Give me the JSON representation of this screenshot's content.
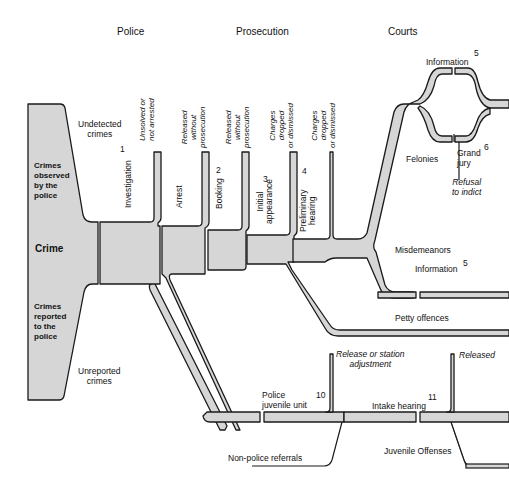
{
  "stages": {
    "police": "Police",
    "prosecution": "Prosecution",
    "courts": "Courts"
  },
  "left_block": {
    "undetected": "Undetected\ncrimes",
    "observed": "Crimes\nobserved\nby the\npolice",
    "crime": "Crime",
    "reported": "Crimes\nreported\nto the\npolice",
    "unreported": "Unreported\ncrimes"
  },
  "steps": {
    "investigation": "Investigation",
    "investigation_num": "1",
    "arrest": "Arrest",
    "booking": "Booking",
    "booking_num": "2",
    "initial": "Initial\nappearance",
    "initial_num": "3",
    "prelim": "Preliminary\nhearing",
    "prelim_num": "4"
  },
  "exits": {
    "unsolved": "Unsolved or\nnot arrested",
    "released1": "Released\nwithout\nprosecution",
    "released2": "Released\nwithout\nprosecution",
    "dropped1": "Charges\ndropped\nor dismissed",
    "dropped2": "Charges\ndropped\nor dismissed"
  },
  "courts": {
    "information_top": "Information",
    "information_top_num": "5",
    "felonies": "Felonies",
    "grand_jury": "Grand\njury",
    "grand_jury_num": "6",
    "refusal": "Refusal\nto indict",
    "misdemeanors": "Misdemeanors",
    "information_mid": "Information",
    "information_mid_num": "5",
    "petty": "Petty offences"
  },
  "juvenile": {
    "release_station": "Release or station\nadjustment",
    "released": "Released",
    "police_unit": "Police\njuvenile unit",
    "police_unit_num": "10",
    "intake": "Intake hearing",
    "intake_num": "11",
    "non_police": "Non-police referrals",
    "offenses": "Juvenile Offenses"
  },
  "colors": {
    "fill": "#d6d6d6",
    "stroke": "#1a1a1a"
  }
}
